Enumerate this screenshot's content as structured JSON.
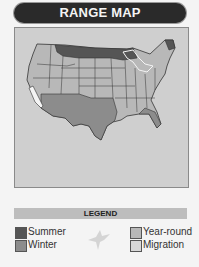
{
  "header": {
    "title": "RANGE MAP"
  },
  "legend": {
    "title": "LEGEND",
    "items": [
      {
        "label": "Summer",
        "color": "#555555"
      },
      {
        "label": "Winter",
        "color": "#8c8c8c"
      },
      {
        "label": "Year-round",
        "color": "#b8b8b8"
      },
      {
        "label": "Migration",
        "color": "#d8d8d8"
      }
    ],
    "icon": "bird-silhouette-icon"
  },
  "map": {
    "region": "United States"
  }
}
